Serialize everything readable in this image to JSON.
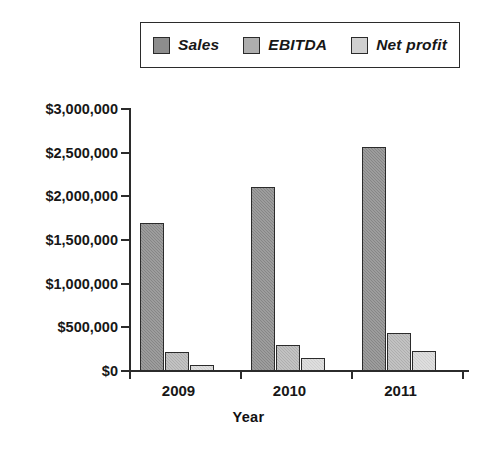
{
  "chart_data": {
    "type": "bar",
    "title": "",
    "xlabel": "Year",
    "ylabel": "",
    "categories": [
      "2009",
      "2010",
      "2011"
    ],
    "series": [
      {
        "name": "Sales",
        "values": [
          1690000,
          2110000,
          2560000
        ],
        "color": "#8d8d8d"
      },
      {
        "name": "EBITDA",
        "values": [
          220000,
          300000,
          440000
        ],
        "color": "#aeaeae"
      },
      {
        "name": "Net profit",
        "values": [
          70000,
          150000,
          230000
        ],
        "color": "#d0d0d0"
      }
    ],
    "ylim": [
      0,
      3000000
    ],
    "ytick_labels": [
      "$3,000,000",
      "$2,500,000",
      "$2,000,000",
      "$1,500,000",
      "$1,000,000",
      "$500,000",
      "$0"
    ],
    "ytick_values": [
      3000000,
      2500000,
      2000000,
      1500000,
      1000000,
      500000,
      0
    ],
    "grid": false,
    "legend_position": "top"
  },
  "legend": {
    "entries": [
      {
        "label": "Sales",
        "swatch": "legend-swatch-sales"
      },
      {
        "label": "EBITDA",
        "swatch": "legend-swatch-ebitda"
      },
      {
        "label": "Net profit",
        "swatch": "legend-swatch-net-profit"
      }
    ]
  },
  "axes": {
    "x_title": "Year"
  }
}
